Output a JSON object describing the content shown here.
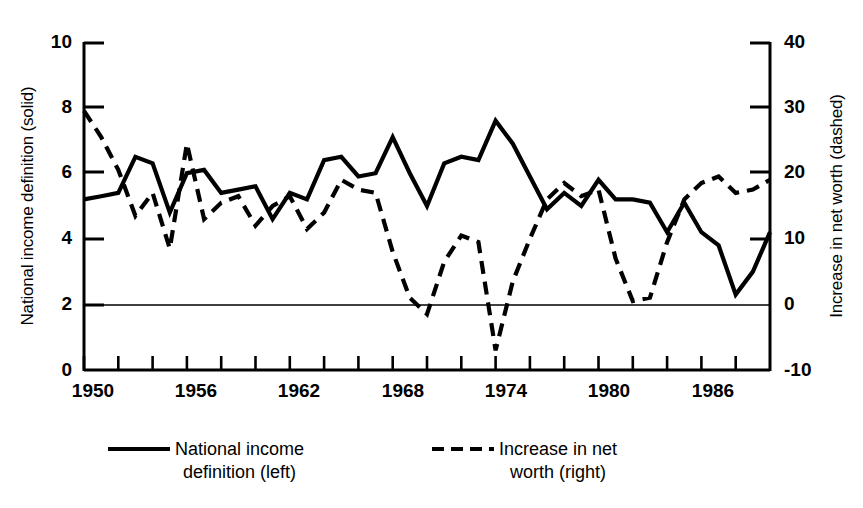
{
  "chart_data": {
    "type": "line",
    "title": "",
    "subtitle": "",
    "xlabel": "",
    "ylabel": "National income definition (solid)",
    "ylabel_right": "Increase in net worth (dashed)",
    "grid": false,
    "legend_position": "bottom",
    "xlim": [
      1950,
      1990
    ],
    "ylim": [
      0,
      10
    ],
    "ylim_right": [
      -10,
      40
    ],
    "x_tick_labels": [
      "1950",
      "1956",
      "1962",
      "1968",
      "1974",
      "1980",
      "1986"
    ],
    "x_tick_values": [
      1950,
      1956,
      1962,
      1968,
      1974,
      1980,
      1986
    ],
    "x_minor_tick_interval": 2,
    "y_tick_labels_left": [
      "10",
      "8",
      "6",
      "4",
      "2",
      "0"
    ],
    "y_tick_values_left": [
      10,
      8,
      6,
      4,
      2,
      0
    ],
    "y_tick_labels_right": [
      "40",
      "30",
      "20",
      "10",
      "0",
      "-10"
    ],
    "y_tick_values_right": [
      40,
      30,
      20,
      10,
      0,
      -10
    ],
    "zero_line_right_axis": 0,
    "series": [
      {
        "name": "National income definition (left)",
        "axis": "left",
        "style": "solid",
        "color": "#000000",
        "x": [
          1950,
          1951,
          1952,
          1953,
          1954,
          1955,
          1956,
          1957,
          1958,
          1959,
          1960,
          1961,
          1962,
          1963,
          1964,
          1965,
          1966,
          1967,
          1968,
          1969,
          1970,
          1971,
          1972,
          1973,
          1974,
          1975,
          1976,
          1977,
          1978,
          1979,
          1980,
          1981,
          1982,
          1983,
          1984,
          1985,
          1986,
          1987,
          1988,
          1989,
          1990
        ],
        "values": [
          5.2,
          5.3,
          5.4,
          6.5,
          6.3,
          4.8,
          6.0,
          6.1,
          5.4,
          5.5,
          5.6,
          4.6,
          5.4,
          5.2,
          6.4,
          6.5,
          5.9,
          6.0,
          7.1,
          6.0,
          5.0,
          6.3,
          6.5,
          6.4,
          7.6,
          6.9,
          5.9,
          4.9,
          5.4,
          5.0,
          5.8,
          5.2,
          5.2,
          5.1,
          4.2,
          5.1,
          4.2,
          3.8,
          2.3,
          3.0,
          4.2
        ]
      },
      {
        "name": "Increase in net worth (right)",
        "axis": "right",
        "style": "dashed",
        "color": "#000000",
        "x": [
          1950,
          1951,
          1952,
          1953,
          1954,
          1955,
          1956,
          1957,
          1958,
          1959,
          1960,
          1961,
          1962,
          1963,
          1964,
          1965,
          1966,
          1967,
          1968,
          1969,
          1970,
          1971,
          1972,
          1973,
          1974,
          1975,
          1976,
          1977,
          1978,
          1979,
          1980,
          1981,
          1982,
          1983,
          1984,
          1985,
          1986,
          1987,
          1988,
          1989,
          1990
        ],
        "values": [
          29.5,
          25.5,
          20.5,
          13.5,
          17.0,
          8.5,
          24.5,
          13.0,
          15.5,
          16.5,
          12.0,
          15.0,
          16.5,
          11.5,
          14.0,
          19.0,
          17.5,
          17.0,
          8.0,
          1.0,
          -1.5,
          6.5,
          10.5,
          9.5,
          -7.0,
          3.5,
          10.0,
          16.0,
          18.5,
          16.5,
          17.5,
          7.0,
          0.5,
          1.0,
          9.5,
          16.0,
          18.5,
          19.5,
          17.0,
          17.5,
          19.0
        ]
      }
    ],
    "legend": [
      {
        "label": "National income\ndefinition (left)",
        "style": "solid"
      },
      {
        "label": "Increase in net\nworth (right)",
        "style": "dashed"
      }
    ]
  },
  "axes": {
    "left_title": "National income definition (solid)",
    "right_title": "Increase in net worth (dashed)"
  }
}
